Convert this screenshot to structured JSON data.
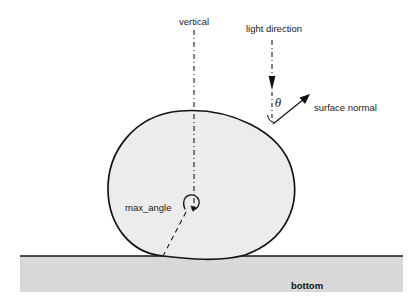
{
  "figure": {
    "title_alt": "Diagram of light direction, surface normal and max_angle on a blob resting on a bottom surface",
    "labels": {
      "vertical": "vertical",
      "light_direction": "light direction",
      "surface_normal": "surface normal",
      "theta": "θ",
      "max_angle": "max_angle",
      "bottom": "bottom"
    },
    "colors": {
      "background": "#ffffff",
      "blob_fill": "#ececec",
      "blob_stroke": "#141414",
      "ground_fill": "#d8d8d8",
      "ground_stroke": "#141414",
      "line": "#1a1a1a",
      "text": "#1a1a1a"
    },
    "geometry": {
      "blob_center": [
        202,
        183
      ],
      "blob_radius_x": 94,
      "blob_radius_y": 72,
      "ground_line_y": 256,
      "ground_left_x": 20,
      "ground_right_x": 403,
      "ground_bottom_y": 292,
      "vertical_axis_x": 194,
      "vertical_axis_top_y": 30,
      "vertical_axis_bottom_y": 207,
      "light_axis_x": 272,
      "light_axis_top_y": 40,
      "light_axis_bottom_y": 123,
      "light_arrow_tip_y": 88,
      "normal_tail": [
        273,
        124
      ],
      "normal_tip": [
        309,
        95
      ],
      "max_angle_arc_center": [
        190,
        203
      ],
      "max_angle_dash_end": [
        163,
        256
      ]
    }
  }
}
